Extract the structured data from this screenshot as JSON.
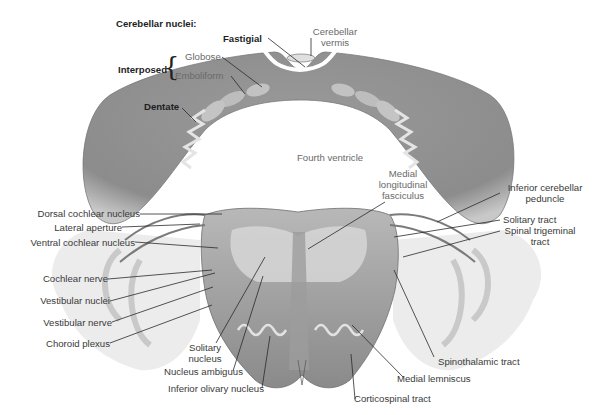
{
  "figure": {
    "header": "Cerebellar nuclei:",
    "colors": {
      "tissue_dark": "#8a8a8a",
      "tissue_mid": "#a7a7a7",
      "tissue_light": "#d6d6d6",
      "ventricle": "#ffffff",
      "leader_line": "#2a2a2a"
    },
    "cerebellar_nuclei": {
      "fastigial": "Fastigial",
      "interposed": "Interposed",
      "globose": "Globose",
      "emboliform": "Emboliform",
      "dentate": "Dentate"
    },
    "top_labels": {
      "cerebellar_vermis": [
        "Cerebellar",
        "vermis"
      ],
      "fourth_ventricle": "Fourth ventricle",
      "medial_longitudinal_fasciculus": [
        "Medial",
        "longitudinal",
        "fasciculus"
      ]
    },
    "left_labels": [
      "Dorsal cochlear nucleus",
      "Lateral aperture",
      "Ventral cochlear nucleus",
      "Cochlear nerve",
      "Vestibular nuclei",
      "Vestibular nerve",
      "Choroid plexus"
    ],
    "right_labels": {
      "inferior_cerebellar_peduncle": [
        "Inferior cerebellar",
        "peduncle"
      ],
      "solitary_tract": "Solitary tract",
      "spinal_trigeminal_tract": [
        "Spinal trigeminal",
        "tract"
      ],
      "spinothalamic_tract": "Spinothalamic tract"
    },
    "bottom_labels": {
      "solitary_nucleus": [
        "Solitary",
        "nucleus"
      ],
      "nucleus_ambiguus": "Nucleus ambiguus",
      "inferior_olivary_nucleus": "Inferior olivary nucleus",
      "medial_lemniscus": "Medial lemniscus",
      "corticospinal_tract": "Corticospinal tract"
    }
  }
}
